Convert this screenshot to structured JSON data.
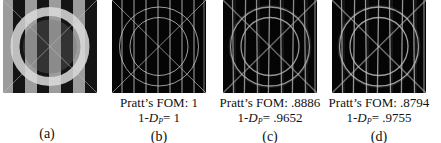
{
  "figure": {
    "panels": [
      {
        "id": "a",
        "label": "(a)",
        "kind": "original",
        "description": "Synthetic test image: vertical dark/gray stripes, bright ring, faint diagonal X",
        "colors": {
          "background": "#9c9c9c",
          "stripe": "#141414",
          "ring": "#dcdcdc",
          "ring_inner": "#6e6e6e",
          "diagonal": "#bfbfbf"
        }
      },
      {
        "id": "b",
        "label": "(b)",
        "kind": "edge-map",
        "fom_label": "Pratt’s FOM: 1",
        "dp_prefix": "1-",
        "dp_symbol": "D",
        "dp_sub": "P",
        "dp_value": "= 1",
        "noise": 0,
        "colors": {
          "background": "#050505",
          "edge": "#d8d8d8"
        }
      },
      {
        "id": "c",
        "label": "(c)",
        "kind": "edge-map",
        "fom_label": "Pratt’s FOM: .8886",
        "dp_prefix": "1-",
        "dp_symbol": "D",
        "dp_sub": "P",
        "dp_value": "= .9652",
        "noise": 1,
        "colors": {
          "background": "#050505",
          "edge": "#b8b8b8"
        }
      },
      {
        "id": "d",
        "label": "(d)",
        "kind": "edge-map",
        "fom_label": "Pratt’s FOM: .8794",
        "dp_prefix": "1-",
        "dp_symbol": "D",
        "dp_sub": "P",
        "dp_value": "= .9755",
        "noise": 1,
        "colors": {
          "background": "#050505",
          "edge": "#c4c4c4"
        }
      }
    ],
    "metrics": {
      "pratts_fom": {
        "b": 1,
        "c": 0.8886,
        "d": 0.8794
      },
      "one_minus_dp": {
        "b": 1,
        "c": 0.9652,
        "d": 0.9755
      }
    }
  }
}
